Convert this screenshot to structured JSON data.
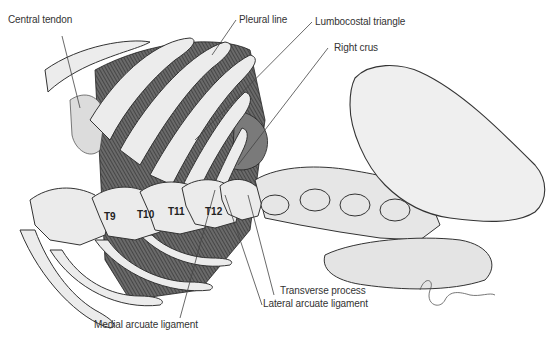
{
  "figure": {
    "labels": {
      "central_tendon": "Central tendon",
      "pleural_line": "Pleural line",
      "lumbocostal_triangle": "Lumbocostal triangle",
      "right_crus": "Right crus",
      "transverse_process": "Transverse process",
      "lateral_arcuate_ligament": "Lateral arcuate ligament",
      "medial_arcuate_ligament": "Medial arcuate ligament"
    },
    "vertebrae": [
      "T9",
      "T10",
      "T11",
      "T12"
    ],
    "signature": "Grafman",
    "colors": {
      "bone": "#e8e8e8",
      "bone_outline": "#333333",
      "muscle": "#555555",
      "crus": "#7a7a7a",
      "label_text": "#333333"
    }
  }
}
